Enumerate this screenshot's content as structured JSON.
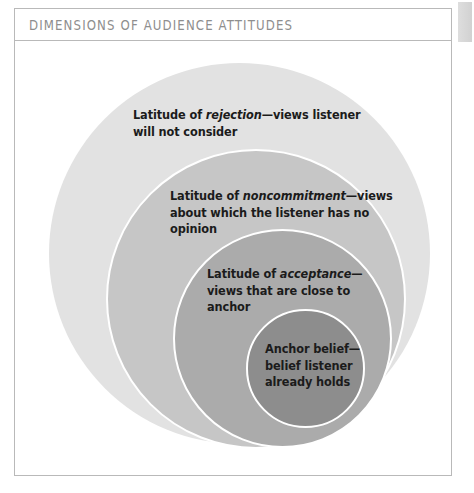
{
  "panel": {
    "title": "DIMENSIONS OF AUDIENCE ATTITUDES"
  },
  "colors": {
    "rejection_fill": "#e2e2e2",
    "noncommitment_fill": "#c6c6c6",
    "acceptance_fill": "#ababab",
    "anchor_fill": "#8d8d8d",
    "ring_separator": "#ffffff",
    "title_text": "#8e8e8e",
    "label_text": "#1b1b1b",
    "panel_border": "#b9b9b9"
  },
  "diagram": {
    "type": "nested-circles",
    "circles": [
      {
        "id": "rejection",
        "level": 1,
        "label_lead": "Latitude of ",
        "label_emphasis": "rejection",
        "label_rest": "—views listener will not consider",
        "label_full": "Latitude of rejection—views listener will not consider"
      },
      {
        "id": "noncommitment",
        "level": 2,
        "label_lead": "Latitude of ",
        "label_emphasis": "noncommitment",
        "label_rest": "—views about which the listener has no opinion",
        "label_full": "Latitude of noncommitment—views about which the listener has no opinion"
      },
      {
        "id": "acceptance",
        "level": 3,
        "label_lead": "Latitude of ",
        "label_emphasis": "acceptance",
        "label_rest": "—views that are close to anchor",
        "label_full": "Latitude of acceptance—views that are close to anchor"
      },
      {
        "id": "anchor",
        "level": 4,
        "label_lead": "",
        "label_emphasis": "",
        "label_rest": "Anchor belief—belief listener already holds",
        "label_full": "Anchor belief—belief listener already holds"
      }
    ]
  }
}
